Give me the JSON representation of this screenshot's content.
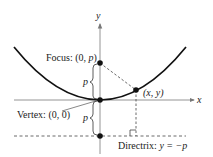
{
  "diagram": {
    "axes": {
      "x_label": "x",
      "y_label": "y"
    },
    "labels": {
      "focus": "Focus: (0, ",
      "focus_var": "p",
      "focus_close": ")",
      "vertex": "Vertex: (0, 0)",
      "point": "(x, y)",
      "directrix_prefix": "Directrix: ",
      "directrix_eq": "y = −p",
      "p_upper": "p",
      "p_lower": "p"
    },
    "colors": {
      "curve": "#111111",
      "axis": "#888888",
      "dashed": "#444444"
    }
  }
}
